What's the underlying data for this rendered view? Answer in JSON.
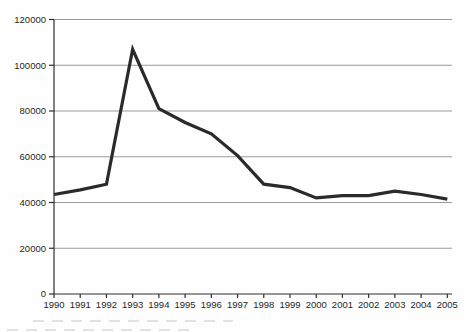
{
  "figure": {
    "title": "",
    "bottom_edge_artifact": "illegible cut-off text fragments"
  },
  "chart_data": {
    "type": "line",
    "title": "",
    "xlabel": "",
    "ylabel": "",
    "x": [
      1990,
      1991,
      1992,
      1993,
      1994,
      1995,
      1996,
      1997,
      1998,
      1999,
      2000,
      2001,
      2002,
      2003,
      2004,
      2005
    ],
    "series": [
      {
        "name": "series-1",
        "values": [
          43500,
          45500,
          48000,
          107000,
          81000,
          75000,
          70000,
          60500,
          48000,
          46500,
          42000,
          43000,
          43000,
          45000,
          43500,
          41500
        ]
      }
    ],
    "ylim": [
      0,
      120000
    ],
    "yticks": [
      0,
      20000,
      40000,
      60000,
      80000,
      100000,
      120000
    ],
    "grid": "horizontal",
    "legend": "none",
    "line_color": "#2a2a2a",
    "line_width": 3.2,
    "gridline_color": "#9b9b9b",
    "axis_color": "#2e2e2e",
    "label_color": "#1f1f1f",
    "background": "#fefefe"
  }
}
